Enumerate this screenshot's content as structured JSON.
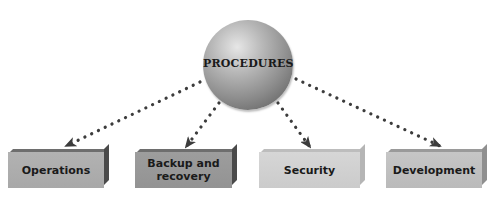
{
  "diagram": {
    "type": "hierarchy",
    "center_node": {
      "label": "PROCEDURES",
      "shape": "sphere",
      "color": "#8c8c8c"
    },
    "child_nodes": [
      {
        "label": "Operations",
        "color": "#ababab"
      },
      {
        "label": "Backup and recovery",
        "line1": "Backup and",
        "line2": "recovery",
        "color": "#969696"
      },
      {
        "label": "Security",
        "color": "#d0d0d0"
      },
      {
        "label": "Development",
        "color": "#bfbfbf"
      }
    ],
    "edges": [
      {
        "from": "PROCEDURES",
        "to": "Operations",
        "style": "dotted-arrow"
      },
      {
        "from": "PROCEDURES",
        "to": "Backup and recovery",
        "style": "dotted-arrow"
      },
      {
        "from": "PROCEDURES",
        "to": "Security",
        "style": "dotted-arrow"
      },
      {
        "from": "PROCEDURES",
        "to": "Development",
        "style": "dotted-arrow"
      }
    ],
    "arrow_color": "#3c3c3c"
  }
}
